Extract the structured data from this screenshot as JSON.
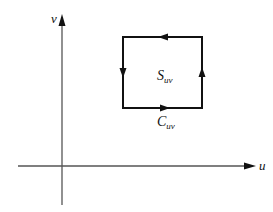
{
  "diagram": {
    "axes": {
      "horizontal_label": "u",
      "vertical_label": "v"
    },
    "region": {
      "label_main": "S",
      "label_sub": "uv",
      "orientation": "counterclockwise"
    },
    "boundary": {
      "label_main": "C",
      "label_sub": "uv"
    },
    "colors": {
      "axis": "#555555",
      "curve": "#111111",
      "background": "#ffffff"
    }
  }
}
